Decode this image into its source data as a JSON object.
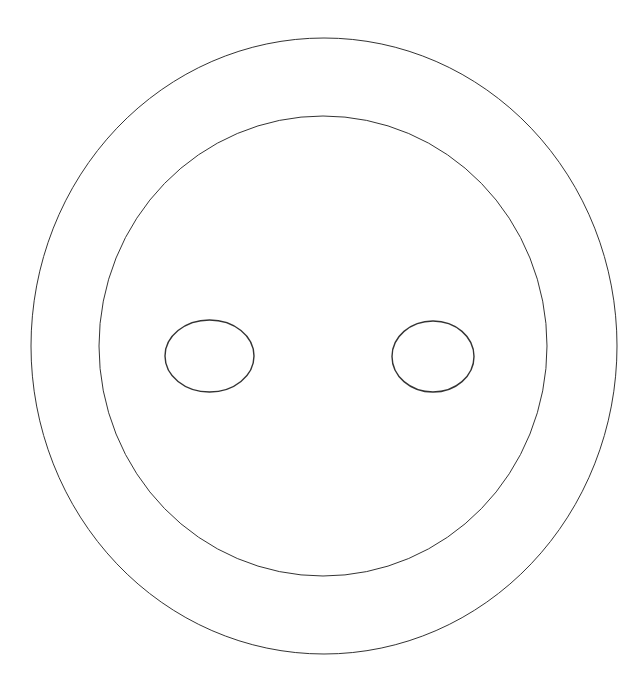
{
  "canvas": {
    "width": 642,
    "height": 689,
    "background": "#ffffff"
  },
  "stroke_color": "#333333",
  "shapes": [
    {
      "name": "outer-ellipse",
      "cx": 324,
      "cy": 346,
      "rx": 293,
      "ry": 308,
      "stroke_width": 1
    },
    {
      "name": "inner-ellipse",
      "cx": 323,
      "cy": 346,
      "rx": 224,
      "ry": 230,
      "stroke_width": 1
    },
    {
      "name": "left-eye-ellipse",
      "cx": 209.5,
      "cy": 356,
      "rx": 44.5,
      "ry": 36,
      "stroke_width": 1.4
    },
    {
      "name": "right-eye-ellipse",
      "cx": 433,
      "cy": 356.5,
      "rx": 41,
      "ry": 35.5,
      "stroke_width": 1.4
    }
  ]
}
